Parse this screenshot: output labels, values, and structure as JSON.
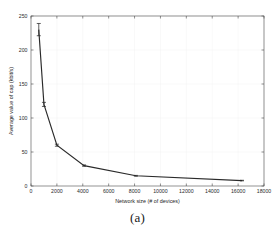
{
  "figure": {
    "caption": "(a)"
  },
  "chart_data": {
    "type": "line",
    "title": "",
    "xlabel": "Network size (# of devices)",
    "ylabel": "Average value of cap (kbit/s)",
    "xlim": [
      0,
      18000
    ],
    "ylim": [
      0,
      250
    ],
    "grid": true,
    "legend": null,
    "xticks": [
      0,
      2000,
      4000,
      6000,
      8000,
      10000,
      12000,
      14000,
      16000,
      18000
    ],
    "xticklabels": [
      "0",
      "2000",
      "4000",
      "6000",
      "8000",
      "10000",
      "12000",
      "14000",
      "16000",
      "18000"
    ],
    "yticks": [
      0,
      50,
      100,
      150,
      200,
      250
    ],
    "yticklabels": [
      "0",
      "50",
      "100",
      "150",
      "200",
      "250"
    ],
    "series": [
      {
        "name": "Average value of cap",
        "color": "#2a2a2a",
        "x": [
          600,
          1000,
          2000,
          4100,
          8100,
          16300
        ],
        "y": [
          230,
          120,
          60,
          30,
          15,
          8
        ],
        "yerr": [
          9,
          3,
          1.5,
          1,
          0.6,
          0.4
        ]
      }
    ]
  }
}
